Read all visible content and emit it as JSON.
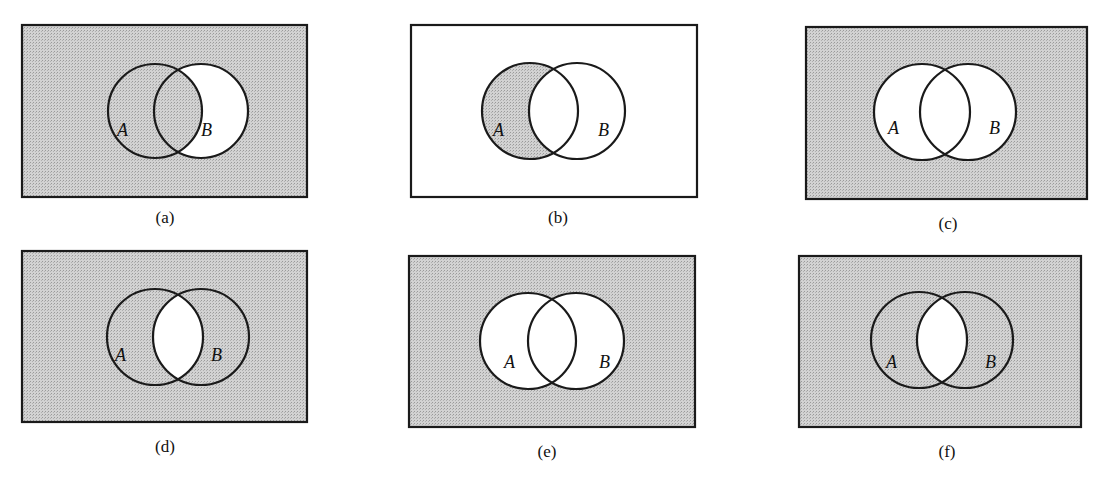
{
  "figure": {
    "shade_color": "#c6c6c6",
    "line_color": "#1a1a1a",
    "panels": [
      {
        "id": "a",
        "caption": "(a)",
        "label_a": "A",
        "label_b": "B",
        "shaded_region": "A ∪ B'",
        "rect": [
          22,
          25,
          285,
          172
        ],
        "circle_a": [
          155,
          111,
          47
        ],
        "circle_b": [
          201,
          111,
          47
        ],
        "label_a_pos": [
          117,
          136
        ],
        "label_b_pos": [
          201,
          136
        ],
        "caption_pos": [
          165,
          223
        ]
      },
      {
        "id": "b",
        "caption": "(b)",
        "label_a": "A",
        "label_b": "B",
        "shaded_region": "A − B",
        "rect": [
          411,
          25,
          286,
          172
        ],
        "circle_a": [
          530,
          111,
          48
        ],
        "circle_b": [
          577,
          111,
          48
        ],
        "label_a_pos": [
          493,
          136
        ],
        "label_b_pos": [
          598,
          136
        ],
        "caption_pos": [
          558,
          223
        ]
      },
      {
        "id": "c",
        "caption": "(c)",
        "label_a": "A",
        "label_b": "B",
        "shaded_region": "(A ∪ B)'",
        "rect": [
          806,
          27,
          281,
          172
        ],
        "circle_a": [
          922,
          112,
          48
        ],
        "circle_b": [
          968,
          112,
          48
        ],
        "label_a_pos": [
          888,
          134
        ],
        "label_b_pos": [
          989,
          134
        ],
        "caption_pos": [
          948,
          229
        ]
      },
      {
        "id": "d",
        "caption": "(d)",
        "label_a": "A",
        "label_b": "B",
        "shaded_region": "(A ∩ B)'",
        "rect": [
          22,
          251,
          285,
          171
        ],
        "circle_a": [
          155,
          337,
          48
        ],
        "circle_b": [
          201,
          337,
          48
        ],
        "label_a_pos": [
          115,
          361
        ],
        "label_b_pos": [
          211,
          361
        ],
        "caption_pos": [
          165,
          452
        ]
      },
      {
        "id": "e",
        "caption": "(e)",
        "label_a": "A",
        "label_b": "B",
        "shaded_region": "(A ∪ B)'",
        "rect": [
          409,
          256,
          286,
          171
        ],
        "circle_a": [
          528,
          341,
          48
        ],
        "circle_b": [
          576,
          341,
          48
        ],
        "label_a_pos": [
          504,
          368
        ],
        "label_b_pos": [
          599,
          368
        ],
        "caption_pos": [
          547,
          457
        ]
      },
      {
        "id": "f",
        "caption": "(f)",
        "label_a": "A",
        "label_b": "B",
        "shaded_region": "(A ∩ B)'",
        "rect": [
          799,
          256,
          282,
          171
        ],
        "circle_a": [
          919,
          340,
          48
        ],
        "circle_b": [
          965,
          340,
          48
        ],
        "label_a_pos": [
          886,
          368
        ],
        "label_b_pos": [
          985,
          368
        ],
        "caption_pos": [
          947,
          457
        ]
      }
    ]
  }
}
